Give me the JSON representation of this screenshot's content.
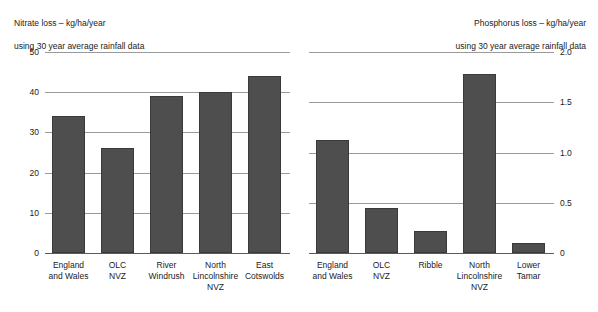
{
  "chart_data": [
    {
      "type": "bar",
      "panel": "left",
      "title": "Nitrate loss – kg/ha/year\nusing 30 year average rainfall data",
      "title_line1": "Nitrate loss – kg/ha/year",
      "title_line2": "using 30 year average rainfall data",
      "xlabel": "",
      "ylabel": "",
      "ylim": [
        0,
        50
      ],
      "yticks": [
        0,
        10,
        20,
        30,
        40,
        50
      ],
      "ytick_labels": [
        "0",
        "10",
        "20",
        "30",
        "40",
        "50"
      ],
      "grid": true,
      "legend": "none",
      "bar_color": "#4e4e4e",
      "categories": [
        "England\nand Wales",
        "OLC\nNVZ",
        "River\nWindrush",
        "North\nLincolnshire\nNVZ",
        "East\nCotswolds"
      ],
      "values": [
        34,
        26,
        39,
        40,
        44
      ]
    },
    {
      "type": "bar",
      "panel": "right",
      "title": "Phosphorus loss – kg/ha/year\nusing 30 year average rainfall data",
      "title_line1": "Phosphorus loss – kg/ha/year",
      "title_line2": "using 30 year average rainfall data",
      "xlabel": "",
      "ylabel": "",
      "ylim": [
        0,
        2.0
      ],
      "yticks": [
        0,
        0.5,
        1.0,
        1.5,
        2.0
      ],
      "ytick_labels": [
        "0",
        "0.5",
        "1.0",
        "1.5",
        "2.0"
      ],
      "grid": true,
      "legend": "none",
      "bar_color": "#4e4e4e",
      "categories": [
        "England\nand Wales",
        "OLC\nNVZ",
        "Ribble",
        "North\nLincolnshire\nNVZ",
        "Lower\nTamar"
      ],
      "values": [
        1.12,
        0.45,
        0.22,
        1.78,
        0.1
      ]
    }
  ]
}
